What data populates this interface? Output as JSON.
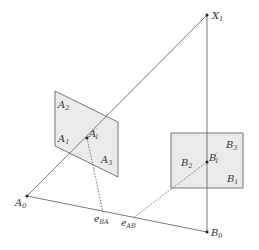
{
  "diagram": {
    "type": "epipolar-geometry",
    "colors": {
      "line": "#555555",
      "panel_fill": "#ebebeb",
      "panel_stroke": "#555555",
      "text": "#333333"
    },
    "points": {
      "X1": {
        "base": "X",
        "sub": "1",
        "prime": ""
      },
      "A0": {
        "base": "A",
        "sub": "0",
        "prime": ""
      },
      "B0": {
        "base": "B",
        "sub": "0",
        "prime": ""
      },
      "A1p": {
        "base": "A",
        "sub": "1",
        "prime": "′"
      },
      "B1p": {
        "base": "B",
        "sub": "1",
        "prime": "′"
      }
    },
    "left_panel_labels": [
      {
        "base": "A",
        "sub": "2"
      },
      {
        "base": "A",
        "sub": "1"
      },
      {
        "base": "A",
        "sub": "3"
      }
    ],
    "right_panel_labels": [
      {
        "base": "B",
        "sub": "3"
      },
      {
        "base": "B",
        "sub": "2"
      },
      {
        "base": "B",
        "sub": "1"
      }
    ],
    "epipoles": [
      {
        "base": "e",
        "sub": "BA"
      },
      {
        "base": "e",
        "sub": "AB"
      }
    ]
  }
}
